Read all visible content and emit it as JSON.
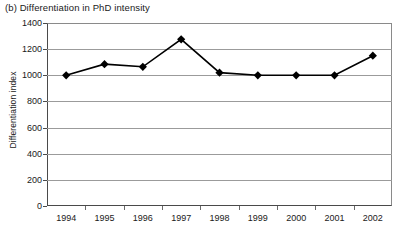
{
  "chart_data": {
    "type": "line",
    "title": "(b) Differentiation in PhD intensity",
    "xlabel": "",
    "ylabel": "Differentiation index",
    "categories": [
      "1994",
      "1995",
      "1996",
      "1997",
      "1998",
      "1999",
      "2000",
      "2001",
      "2002"
    ],
    "values": [
      1000,
      1085,
      1065,
      1275,
      1020,
      1000,
      1000,
      1000,
      1150
    ],
    "series": [
      {
        "name": "Differentiation index",
        "values": [
          1000,
          1085,
          1065,
          1275,
          1020,
          1000,
          1000,
          1000,
          1150
        ]
      }
    ],
    "ylim": [
      0,
      1400
    ],
    "ytick_step": 200,
    "yticks": [
      0,
      200,
      400,
      600,
      800,
      1000,
      1200,
      1400
    ],
    "ytick_labels": [
      "0",
      "200",
      "400",
      "600",
      "800",
      "1000",
      "1200",
      "1400"
    ],
    "grid": true,
    "grid_axis": "y",
    "legend": false,
    "legend_position": "none",
    "marker": "diamond",
    "marker_color": "#000000",
    "line_color": "#000000",
    "background_color": "#ffffff",
    "annotations": []
  }
}
